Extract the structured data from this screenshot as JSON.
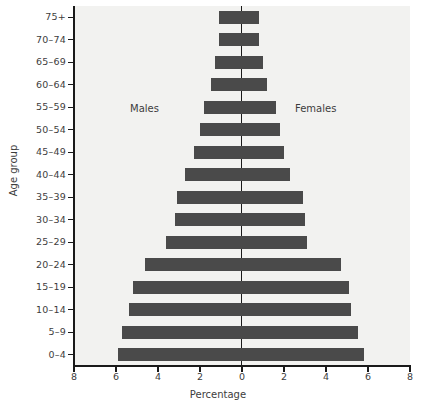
{
  "chart_data": {
    "type": "bar",
    "subtype": "population-pyramid",
    "title": "",
    "xlabel": "Percentage",
    "ylabel": "Age group",
    "grid": false,
    "legend_position": "in-plot-annotations",
    "xlim": [
      -8,
      8
    ],
    "xticks": [
      8,
      6,
      4,
      2,
      0,
      2,
      4,
      6,
      8
    ],
    "xtick_labels": [
      "8",
      "6",
      "4",
      "2",
      "0",
      "2",
      "4",
      "6",
      "8"
    ],
    "categories": [
      "0-4",
      "5-9",
      "10-14",
      "15-19",
      "20-24",
      "25-29",
      "30-34",
      "35-39",
      "40-44",
      "45-49",
      "50-54",
      "55-59",
      "60-64",
      "65-69",
      "70-74",
      "75+"
    ],
    "series": [
      {
        "name": "Males",
        "side": "left",
        "values": [
          5.9,
          5.7,
          5.4,
          5.2,
          4.6,
          3.6,
          3.2,
          3.1,
          2.7,
          2.3,
          2.0,
          1.8,
          1.5,
          1.3,
          1.1,
          1.1
        ]
      },
      {
        "name": "Females",
        "side": "right",
        "values": [
          5.8,
          5.5,
          5.2,
          5.1,
          4.7,
          3.1,
          3.0,
          2.9,
          2.3,
          2.0,
          1.8,
          1.6,
          1.2,
          1.0,
          0.8,
          0.8
        ]
      }
    ],
    "annotations": [
      {
        "text": "Males",
        "side": "left"
      },
      {
        "text": "Females",
        "side": "right"
      }
    ],
    "colors": {
      "bar": "#4a4a4a",
      "plot_background": "#f2f2f0",
      "axis": "#1a1a1a",
      "text": "#3d3d3d",
      "page_background": "#ffffff"
    }
  }
}
